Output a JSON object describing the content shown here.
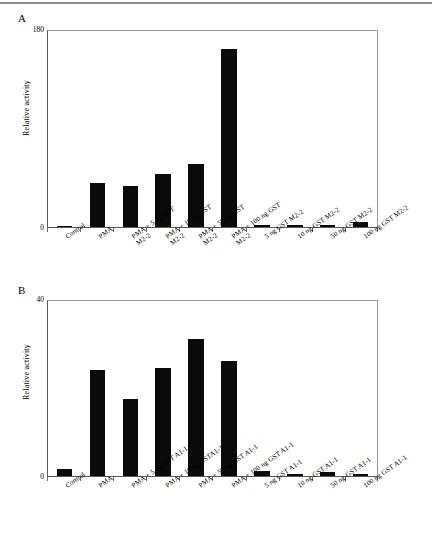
{
  "figure": {
    "panels": [
      {
        "letter": "A",
        "ylabel": "Relative activity",
        "yticks": [
          "180",
          "0"
        ]
      },
      {
        "letter": "B",
        "ylabel": "Relative activity",
        "yticks": [
          "40",
          "0"
        ]
      }
    ]
  },
  "chart_data": [
    {
      "type": "bar",
      "panel": "A",
      "title": "",
      "xlabel": "",
      "ylabel": "Relative activity",
      "ylim": [
        0,
        180
      ],
      "yticks": [
        0,
        180
      ],
      "grid": false,
      "legend": null,
      "bar_color": "#0a0a0a",
      "categories": [
        "Control",
        "PMA",
        "PMA + 5 ng GST M2-2",
        "PMA + 10 ng GST M2-2",
        "PMA + 50 ng GST M2-2",
        "PMA + 100 ng GST M2-2",
        "5 ng GST M2-2",
        "10 ng GST M2-2",
        "50 ng GST M2-2",
        "100 ng GST M2-2"
      ],
      "values": [
        1,
        40,
        37,
        48,
        57,
        162,
        2,
        1.5,
        1.5,
        5
      ]
    },
    {
      "type": "bar",
      "panel": "B",
      "title": "",
      "xlabel": "",
      "ylabel": "Relative activity",
      "ylim": [
        0,
        40
      ],
      "yticks": [
        0,
        40
      ],
      "grid": false,
      "legend": null,
      "bar_color": "#0a0a0a",
      "categories": [
        "Control",
        "PMA",
        "PMA + 5 ng GST A1-1",
        "PMA + 10 ng GST A1-1",
        "PMA + 50 ng GST A1-1",
        "PMA + 100 ng GST A1-1",
        "5 ng GST A1-1",
        "10 ng GST A1-1",
        "50 ng GST A1-1",
        "100 ng GST A1-1"
      ],
      "values": [
        1.5,
        24,
        17.5,
        24.5,
        31,
        26,
        1.2,
        0.5,
        0.8,
        0.5
      ]
    }
  ],
  "labels_a": [
    {
      "l1": "Control",
      "l2": ""
    },
    {
      "l1": "PMA",
      "l2": ""
    },
    {
      "l1": "PMA + 5 ng GST",
      "l2": "M2-2"
    },
    {
      "l1": "PMA + 10 ng GST",
      "l2": "M2-2"
    },
    {
      "l1": "PMA + 50 ng GST",
      "l2": "M2-2"
    },
    {
      "l1": "PMA + 100 ng GST",
      "l2": "M2-2"
    },
    {
      "l1": "5 ng GST M2-2",
      "l2": ""
    },
    {
      "l1": "10 ng GST M2-2",
      "l2": ""
    },
    {
      "l1": "50 ng GST M2-2",
      "l2": ""
    },
    {
      "l1": "100 ng GST M2-2",
      "l2": ""
    }
  ],
  "labels_b": [
    {
      "l1": "Control",
      "l2": ""
    },
    {
      "l1": "PMA",
      "l2": ""
    },
    {
      "l1": "PMA + 5 ng GST A1-1",
      "l2": ""
    },
    {
      "l1": "PMA + 10 ng GSTA1-1",
      "l2": ""
    },
    {
      "l1": "PMA + 50 ng GST A1-1",
      "l2": ""
    },
    {
      "l1": "PMA + 100 ng GST A1-1",
      "l2": ""
    },
    {
      "l1": "5 ng GST A1-1",
      "l2": ""
    },
    {
      "l1": "10 ng GST A1-1",
      "l2": ""
    },
    {
      "l1": "50 ng GST A1-1",
      "l2": ""
    },
    {
      "l1": "100 ng GST A1-1",
      "l2": ""
    }
  ]
}
